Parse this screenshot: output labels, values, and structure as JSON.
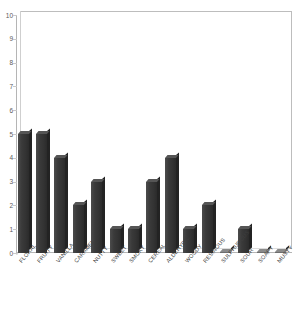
{
  "chart_data": {
    "type": "bar",
    "title": "",
    "xlabel": "",
    "ylabel": "",
    "ylim": [
      0,
      10
    ],
    "grid": false,
    "legend": "none",
    "yticks": [
      "0",
      "1",
      "2",
      "3",
      "4",
      "5",
      "6",
      "7",
      "8",
      "9",
      "10"
    ],
    "categories": [
      "FLORAL",
      "FRUITY",
      "VANILLA",
      "CARAMEL",
      "NUTTY",
      "SWEET",
      "SMOKY",
      "CEREAL",
      "ALDEHYDIC",
      "WOODY",
      "RESINOUS",
      "SULPHUROUS",
      "SOUR",
      "SOAPY",
      "MUSTY"
    ],
    "values": [
      5,
      5,
      4,
      2,
      3,
      1,
      1,
      3,
      4,
      1,
      2,
      0,
      1,
      0,
      0
    ],
    "bar_color": "#333333",
    "bar_top_color": "#555555",
    "bar_side_color": "#232323",
    "axis_color": "#b5b5b5",
    "tick_label_color": "#5a5a5a",
    "category_label_color": "#3f3f3f",
    "background": "#ffffff"
  }
}
